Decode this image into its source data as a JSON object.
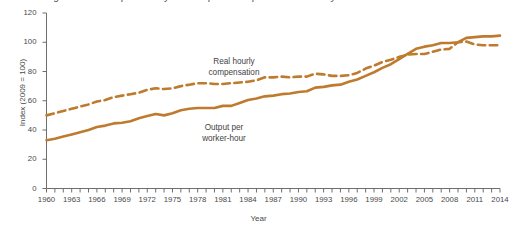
{
  "chart_data": {
    "type": "line",
    "title": "Figure: Growth in productivity and compensation per hour are closely related",
    "xlabel": "Year",
    "ylabel": "Index (2009 = 100)",
    "xlim": [
      1960,
      2014
    ],
    "ylim": [
      0,
      120
    ],
    "yticks": [
      0,
      20,
      40,
      60,
      80,
      100,
      120
    ],
    "xticks": [
      1960,
      1963,
      1966,
      1969,
      1972,
      1975,
      1978,
      1981,
      1984,
      1987,
      1990,
      1993,
      1996,
      1999,
      2002,
      2005,
      2008,
      2011,
      2014
    ],
    "xtick_minor_step": 1,
    "grid": false,
    "legend_position": "inline-annotations",
    "line_color": "#be7b2e",
    "x": [
      1960,
      1961,
      1962,
      1963,
      1964,
      1965,
      1966,
      1967,
      1968,
      1969,
      1970,
      1971,
      1972,
      1973,
      1974,
      1975,
      1976,
      1977,
      1978,
      1979,
      1980,
      1981,
      1982,
      1983,
      1984,
      1985,
      1986,
      1987,
      1988,
      1989,
      1990,
      1991,
      1992,
      1993,
      1994,
      1995,
      1996,
      1997,
      1998,
      1999,
      2000,
      2001,
      2002,
      2003,
      2004,
      2005,
      2006,
      2007,
      2008,
      2009,
      2010,
      2011,
      2012,
      2013,
      2014
    ],
    "series": [
      {
        "name": "Real hourly compensation",
        "style": "dashed",
        "annotation": "Real hourly\ncompensation",
        "values": [
          50,
          51.5,
          53,
          54.5,
          56,
          57.5,
          59.5,
          60.5,
          62.5,
          63.5,
          64.5,
          65.5,
          67.5,
          68.5,
          68,
          68.5,
          70,
          71,
          72,
          72,
          71.5,
          71.5,
          72,
          72.5,
          73,
          74,
          76,
          76,
          76.5,
          76,
          76.5,
          76.5,
          78.5,
          78,
          77,
          77,
          77.5,
          79,
          82,
          84,
          86.5,
          88,
          90,
          91.5,
          92,
          92,
          93.5,
          95,
          95.5,
          100,
          100.5,
          98.5,
          98,
          98,
          98
        ]
      },
      {
        "name": "Output per worker-hour",
        "style": "solid",
        "annotation": "Output per\nworker-hour",
        "values": [
          33,
          34,
          35.5,
          37,
          38.5,
          40,
          42,
          43,
          44.5,
          45,
          46,
          48,
          49.5,
          51,
          50,
          51.5,
          53.5,
          54.5,
          55,
          55,
          55,
          56.5,
          56.5,
          58.5,
          60.5,
          61.5,
          63,
          63.5,
          64.5,
          65,
          66,
          66.5,
          69,
          69.5,
          70.5,
          71,
          73,
          74.5,
          77,
          79.5,
          82.5,
          85,
          88.5,
          92,
          95.5,
          97,
          98,
          99.5,
          99.5,
          100,
          103,
          103.5,
          104,
          104,
          104.5
        ]
      }
    ]
  },
  "axes": {
    "y_title": "Index (2009 = 100)",
    "x_title": "Year",
    "ytick_labels": [
      "0",
      "20",
      "40",
      "60",
      "80",
      "100",
      "120"
    ],
    "xtick_labels": [
      "1960",
      "1963",
      "1966",
      "1969",
      "1972",
      "1975",
      "1978",
      "1981",
      "1984",
      "1987",
      "1990",
      "1993",
      "1996",
      "1999",
      "2002",
      "2005",
      "2008",
      "2011",
      "2014"
    ]
  },
  "annotations": {
    "compensation_line1": "Real hourly",
    "compensation_line2": "compensation",
    "output_line1": "Output per",
    "output_line2": "worker-hour"
  }
}
